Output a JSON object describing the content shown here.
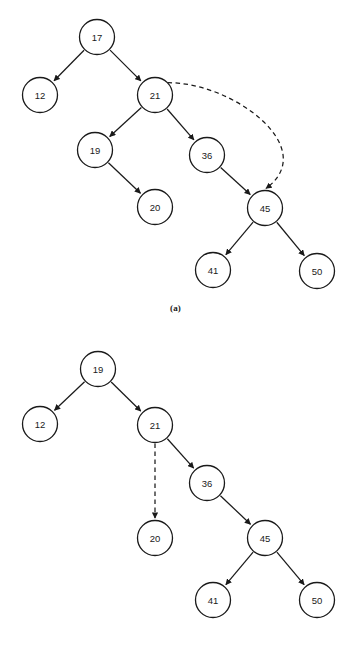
{
  "figure": {
    "background_color": "#ffffff",
    "stroke_color": "#1a1a1a",
    "node_fill_color": "#ffffff",
    "node_radius": 17.5,
    "panels": [
      {
        "id": "a",
        "caption": "(a)",
        "nodes": [
          {
            "key": "17",
            "label": "17",
            "cx": 97,
            "cy": 37
          },
          {
            "key": "12",
            "label": "12",
            "cx": 40,
            "cy": 95
          },
          {
            "key": "21",
            "label": "21",
            "cx": 155,
            "cy": 95
          },
          {
            "key": "19",
            "label": "19",
            "cx": 95,
            "cy": 150
          },
          {
            "key": "36",
            "label": "36",
            "cx": 207,
            "cy": 155
          },
          {
            "key": "20",
            "label": "20",
            "cx": 155,
            "cy": 207
          },
          {
            "key": "45",
            "label": "45",
            "cx": 265,
            "cy": 208
          },
          {
            "key": "41",
            "label": "41",
            "cx": 213,
            "cy": 270
          },
          {
            "key": "50",
            "label": "50",
            "cx": 317,
            "cy": 271
          }
        ],
        "edges": [
          {
            "from": "17",
            "to": "12",
            "style": "solid",
            "arrow": true
          },
          {
            "from": "17",
            "to": "21",
            "style": "solid",
            "arrow": true
          },
          {
            "from": "21",
            "to": "19",
            "style": "solid",
            "arrow": true
          },
          {
            "from": "21",
            "to": "36",
            "style": "solid",
            "arrow": true
          },
          {
            "from": "19",
            "to": "20",
            "style": "solid",
            "arrow": true
          },
          {
            "from": "36",
            "to": "45",
            "style": "solid",
            "arrow": true
          },
          {
            "from": "45",
            "to": "41",
            "style": "solid",
            "arrow": true
          },
          {
            "from": "45",
            "to": "50",
            "style": "solid",
            "arrow": true
          },
          {
            "from": "21",
            "to": "45",
            "style": "dashed-curve",
            "arrow": true
          }
        ]
      },
      {
        "id": "b",
        "caption": "(b)",
        "nodes": [
          {
            "key": "19",
            "label": "19",
            "cx": 98,
            "cy": 35
          },
          {
            "key": "12",
            "label": "12",
            "cx": 40,
            "cy": 90
          },
          {
            "key": "21",
            "label": "21",
            "cx": 155,
            "cy": 91
          },
          {
            "key": "36",
            "label": "36",
            "cx": 207,
            "cy": 149
          },
          {
            "key": "20",
            "label": "20",
            "cx": 155,
            "cy": 204
          },
          {
            "key": "45",
            "label": "45",
            "cx": 265,
            "cy": 204
          },
          {
            "key": "41",
            "label": "41",
            "cx": 213,
            "cy": 266
          },
          {
            "key": "50",
            "label": "50",
            "cx": 317,
            "cy": 266
          }
        ],
        "edges": [
          {
            "from": "19",
            "to": "12",
            "style": "solid",
            "arrow": true
          },
          {
            "from": "19",
            "to": "21",
            "style": "solid",
            "arrow": true
          },
          {
            "from": "21",
            "to": "36",
            "style": "solid",
            "arrow": true
          },
          {
            "from": "21",
            "to": "20",
            "style": "dashed",
            "arrow": true
          },
          {
            "from": "36",
            "to": "45",
            "style": "solid",
            "arrow": true
          },
          {
            "from": "45",
            "to": "41",
            "style": "solid",
            "arrow": true
          },
          {
            "from": "45",
            "to": "50",
            "style": "solid",
            "arrow": true
          }
        ]
      }
    ]
  }
}
